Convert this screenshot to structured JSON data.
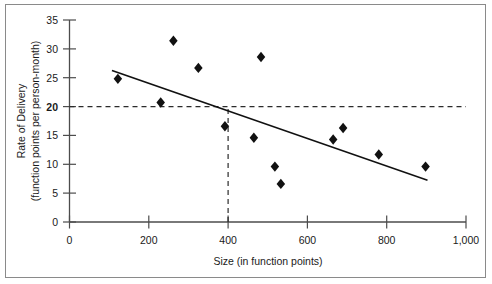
{
  "chart_data": {
    "type": "scatter",
    "title": "",
    "xlabel": "Size (in function points)",
    "ylabel_line1": "Rate of Delivery",
    "ylabel_line2": "(function points per person-month)",
    "xlim": [
      0,
      1000
    ],
    "ylim": [
      0,
      35
    ],
    "xticks": [
      0,
      200,
      400,
      600,
      800,
      1000
    ],
    "xtick_labels": [
      "0",
      "200",
      "400",
      "600",
      "800",
      "1,000"
    ],
    "yticks": [
      0,
      5,
      10,
      15,
      20,
      25,
      30,
      35
    ],
    "ytick_labels": [
      "0",
      "5",
      "10",
      "15",
      "20",
      "25",
      "30",
      "35"
    ],
    "ytick_emphasis": "20",
    "grid": false,
    "legend": false,
    "marker_shape": "diamond",
    "marker_color": "#111111",
    "points": [
      {
        "x": 122,
        "y": 24.8
      },
      {
        "x": 230,
        "y": 20.7
      },
      {
        "x": 262,
        "y": 31.4
      },
      {
        "x": 325,
        "y": 26.7
      },
      {
        "x": 392,
        "y": 16.6
      },
      {
        "x": 465,
        "y": 14.6
      },
      {
        "x": 483,
        "y": 28.6
      },
      {
        "x": 518,
        "y": 9.6
      },
      {
        "x": 533,
        "y": 6.6
      },
      {
        "x": 665,
        "y": 14.3
      },
      {
        "x": 690,
        "y": 16.3
      },
      {
        "x": 780,
        "y": 11.7
      },
      {
        "x": 898,
        "y": 9.6
      }
    ],
    "trend_line": {
      "color": "#111111",
      "x_start": 109,
      "y_start": 26.2,
      "x_end": 901,
      "y_end": 7.3
    },
    "reference_lines": [
      {
        "orientation": "horizontal",
        "value": 20,
        "style": "dashed",
        "from": 0,
        "to": 1000
      },
      {
        "orientation": "vertical",
        "value": 400,
        "style": "dashed",
        "from": 0,
        "to": 20
      }
    ]
  }
}
